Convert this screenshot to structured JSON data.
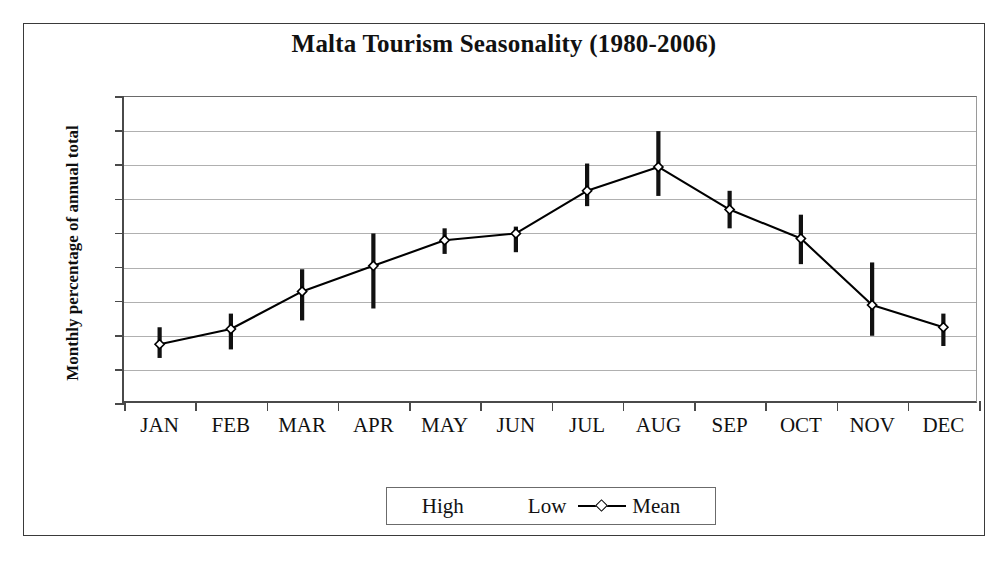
{
  "chart_data": {
    "type": "line",
    "title": "Malta Tourism Seasonality (1980-2006)",
    "xlabel": "",
    "ylabel": "Monthly percentage of annual total",
    "ylim": [
      0,
      18
    ],
    "ytick_labels": [
      "18%",
      "16%",
      "14%",
      "12%",
      "10%",
      "8%",
      "6%",
      "4%",
      "2%",
      "0%"
    ],
    "ytick_values": [
      18,
      16,
      14,
      12,
      10,
      8,
      6,
      4,
      2,
      0
    ],
    "grid": true,
    "legend_position": "bottom",
    "categories": [
      "JAN",
      "FEB",
      "MAR",
      "APR",
      "MAY",
      "JUN",
      "JUL",
      "AUG",
      "SEP",
      "OCT",
      "NOV",
      "DEC"
    ],
    "series": [
      {
        "name": "Mean",
        "values": [
          3.5,
          4.4,
          6.6,
          8.1,
          9.6,
          10.0,
          12.5,
          13.9,
          11.4,
          9.7,
          5.8,
          4.5
        ]
      },
      {
        "name": "High",
        "values": [
          4.5,
          5.3,
          7.9,
          10.0,
          10.3,
          10.4,
          14.1,
          16.0,
          12.5,
          11.1,
          8.3,
          5.3
        ]
      },
      {
        "name": "Low",
        "values": [
          2.7,
          3.2,
          4.9,
          5.6,
          8.8,
          8.9,
          11.6,
          12.2,
          10.3,
          8.2,
          4.0,
          3.4
        ]
      }
    ]
  },
  "legend": {
    "high_label": "High",
    "low_label": "Low",
    "mean_label": "Mean"
  },
  "colors": {
    "line": "#000000",
    "error_bar": "#111111",
    "grid": "#b0b0b0",
    "axis": "#4a4a4a",
    "frame": "#3a3a3a",
    "background": "#ffffff"
  }
}
